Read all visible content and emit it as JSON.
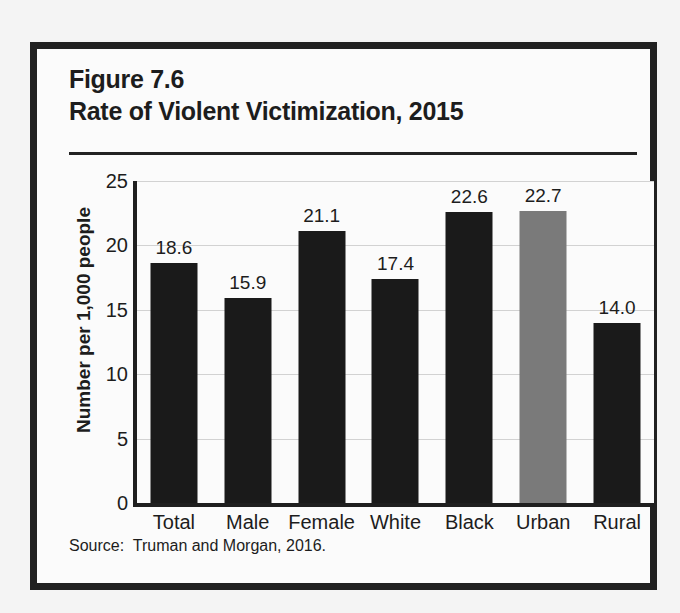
{
  "page": {
    "background_color": "#f4f4f4",
    "bleed_header_text": " ",
    "bleed_footer_text": " "
  },
  "figure": {
    "number_label": "Figure 7.6",
    "title": "Rate of Violent Victimization, 2015",
    "source_note": "Source:  Truman and Morgan, 2016.",
    "frame_color": "#212121",
    "background_color": "#fbfbfb"
  },
  "colors": {
    "bar_dark": "#1a1a1a",
    "bar_gray": "#7a7a7a",
    "axis": "#1f1f1f",
    "gridline": "#d2d2d2",
    "text": "#1d1d1d"
  },
  "chart_data": {
    "type": "bar",
    "title": "Rate of Violent Victimization, 2015",
    "subtitle": "Figure 7.6",
    "xlabel": "",
    "ylabel": "Number per 1,000 people",
    "ylim": [
      0,
      25
    ],
    "yticks": [
      0,
      5,
      10,
      15,
      20,
      25
    ],
    "ytick_labels": [
      "0",
      "5",
      "10",
      "15",
      "20",
      "25"
    ],
    "grid": true,
    "legend": false,
    "categories": [
      "Total",
      "Male",
      "Female",
      "White",
      "Black",
      "Urban",
      "Rural"
    ],
    "values": [
      18.6,
      15.9,
      21.1,
      17.4,
      22.6,
      22.7,
      14.0
    ],
    "value_labels": [
      "18.6",
      "15.9",
      "21.1",
      "17.4",
      "22.6",
      "22.7",
      "14.0"
    ],
    "bar_colors": [
      "#1a1a1a",
      "#1a1a1a",
      "#1a1a1a",
      "#1a1a1a",
      "#1a1a1a",
      "#7a7a7a",
      "#1a1a1a"
    ],
    "source": "Truman and Morgan, 2016."
  }
}
